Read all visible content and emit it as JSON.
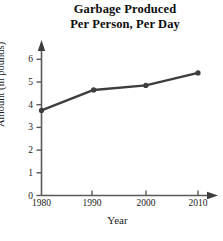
{
  "chart_data": {
    "type": "line",
    "title": "Garbage Produced Per Person, Per Day",
    "title_lines": [
      "Garbage Produced",
      "Per Person, Per Day"
    ],
    "xlabel": "Year",
    "ylabel": "Amount (in pounds)",
    "x": [
      1980,
      1990,
      2000,
      2010
    ],
    "values": [
      3.75,
      4.65,
      4.85,
      5.4
    ],
    "categories": [
      "1980",
      "1990",
      "2000",
      "2010"
    ],
    "xtick_labels": [
      "1980",
      "1990",
      "2000",
      "2010"
    ],
    "ytick_labels": [
      "0",
      "1",
      "2",
      "3",
      "4",
      "5",
      "6"
    ],
    "ytick_values": [
      0,
      1,
      2,
      3,
      4,
      5,
      6
    ],
    "xlim": [
      1980,
      2014
    ],
    "ylim": [
      0,
      6.4
    ],
    "grid": false,
    "legend": false,
    "marker": "circle",
    "line_color": "#3d3d3d",
    "marker_color": "#3d3d3d",
    "axis_color": "#595959"
  }
}
